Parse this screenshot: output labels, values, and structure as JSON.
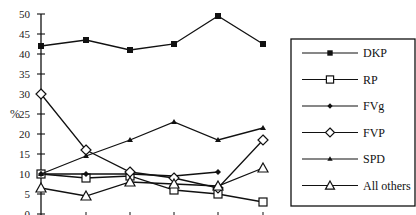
{
  "chart_data": {
    "type": "line",
    "title": "",
    "xlabel": "",
    "ylabel": "%",
    "ylim": [
      0,
      50
    ],
    "yticks": [
      0,
      5,
      10,
      15,
      20,
      25,
      30,
      35,
      40,
      45,
      50
    ],
    "grid": false,
    "legend_position": "right",
    "x": [
      1,
      2,
      3,
      4,
      5,
      6
    ],
    "series": [
      {
        "name": "DKP",
        "marker": "filled-square",
        "values": [
          42,
          43.5,
          41,
          42.5,
          49.5,
          42.5
        ]
      },
      {
        "name": "RP",
        "marker": "open-square",
        "values": [
          10,
          9,
          9.5,
          6,
          5,
          3
        ]
      },
      {
        "name": "FVg",
        "marker": "filled-diamond",
        "values": [
          10,
          10,
          10,
          9.5,
          10.5,
          null
        ]
      },
      {
        "name": "FVP",
        "marker": "open-diamond",
        "values": [
          30,
          16,
          10.5,
          9,
          6.5,
          18.5
        ]
      },
      {
        "name": "SPD",
        "marker": "filled-triangle",
        "values": [
          10,
          14.5,
          18.5,
          23,
          18.5,
          21.5
        ]
      },
      {
        "name": "All others",
        "marker": "open-triangle",
        "values": [
          6.5,
          4.5,
          8,
          7.5,
          7,
          11.5
        ]
      }
    ]
  },
  "legend": {
    "items": [
      "DKP",
      "RP",
      "FVg",
      "FVP",
      "SPD",
      "All others"
    ]
  }
}
